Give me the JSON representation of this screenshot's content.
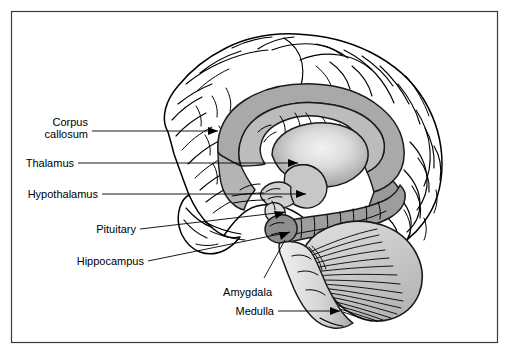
{
  "figure": {
    "kind": "anatomical-diagram",
    "view": "midsagittal section, facing left",
    "frame_color": "#3b3b3b",
    "background_color": "#ffffff",
    "line_color": "#000000"
  },
  "labels": {
    "corpus_callosum_line1": "Corpus",
    "corpus_callosum_line2": "callosum",
    "thalamus": "Thalamus",
    "hypothalamus": "Hypothalamus",
    "pituitary": "Pituitary",
    "hippocampus": "Hippocampus",
    "amygdala": "Amygdala",
    "medulla": "Medulla"
  },
  "structures": [
    {
      "name": "cerebral-cortex",
      "fill": "#ffffff",
      "note": "convoluted gyri and sulci outline"
    },
    {
      "name": "corpus-callosum",
      "fill": "#a8a8a8",
      "note": "arching band over thalamus"
    },
    {
      "name": "thalamus",
      "fill": "#dedede",
      "note": "large ovoid with radial highlight"
    },
    {
      "name": "hypothalamus",
      "fill": "#c9c9c9",
      "note": "below thalamus"
    },
    {
      "name": "pituitary",
      "fill": "#d5d5d5",
      "note": "small stalked gland"
    },
    {
      "name": "hippocampus",
      "fill": "#9e9e9e",
      "note": "segmented curved body"
    },
    {
      "name": "amygdala",
      "fill": "#8f8f8f",
      "note": "bulb at anterior hippocampus"
    },
    {
      "name": "cerebellum",
      "fill": "#d0d0d0",
      "note": "radiating folia fan"
    },
    {
      "name": "brainstem-medulla",
      "fill": "#d8d8d8",
      "note": "descending stalk"
    }
  ]
}
